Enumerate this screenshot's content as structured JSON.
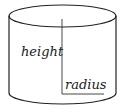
{
  "diagram": {
    "shape": "cylinder",
    "labels": {
      "height": "height",
      "radius": "radius"
    },
    "colors": {
      "stroke": "#222222",
      "text": "#1a1a1a",
      "background": "#ffffff"
    }
  }
}
